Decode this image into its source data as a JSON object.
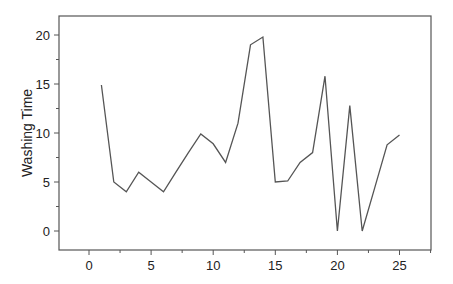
{
  "chart_data": {
    "type": "line",
    "title": "",
    "xlabel": "",
    "ylabel": "Washing Time",
    "xlim": [
      -2.5,
      27.5
    ],
    "ylim": [
      -2,
      22
    ],
    "xticks": [
      0,
      5,
      10,
      15,
      20,
      25
    ],
    "yticks": [
      0,
      5,
      10,
      15,
      20
    ],
    "x_minor_step": 2.5,
    "y_minor_step": 2.5,
    "grid": false,
    "legend": null,
    "series": [
      {
        "name": "Washing Time",
        "color": "#555555",
        "x": [
          1,
          2,
          3,
          4,
          5,
          6,
          7,
          8,
          9,
          10,
          11,
          12,
          13,
          14,
          15,
          16,
          17,
          18,
          19,
          20,
          21,
          22,
          23,
          24,
          25
        ],
        "values": [
          14.9,
          5.0,
          4.0,
          6.0,
          5.0,
          4.0,
          6.0,
          8.0,
          9.9,
          8.9,
          7.0,
          11.0,
          19.0,
          19.8,
          5.0,
          5.1,
          7.0,
          8.0,
          15.8,
          0.0,
          12.8,
          0.0,
          4.4,
          8.8,
          9.8
        ]
      }
    ]
  }
}
